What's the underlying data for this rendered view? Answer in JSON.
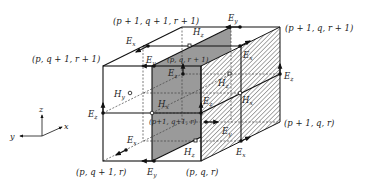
{
  "colors": {
    "line": "#111111",
    "gray_face": "#9a9a9a",
    "hatch": "#555555",
    "background": "#ffffff"
  },
  "vertex_labels": {
    "top_back_left": "(p + 1, q + 1, r + 1)",
    "top_back_right": "(p + 1, q, r + 1)",
    "top_front_left": "(p, q + 1, r + 1)",
    "top_center": "(p, q, r + 1)",
    "mid_center": "(p+1, q+1, r)",
    "mid_right": "(p + 1, q, r)",
    "bottom_left": "(p, q + 1, r)",
    "bottom_center": "(p, q, r)"
  },
  "field_labels": {
    "E": "E",
    "H": "H",
    "sub_x": "x",
    "sub_y": "y",
    "sub_z": "z"
  },
  "axes": {
    "x": "x",
    "y": "y",
    "z": "z"
  }
}
